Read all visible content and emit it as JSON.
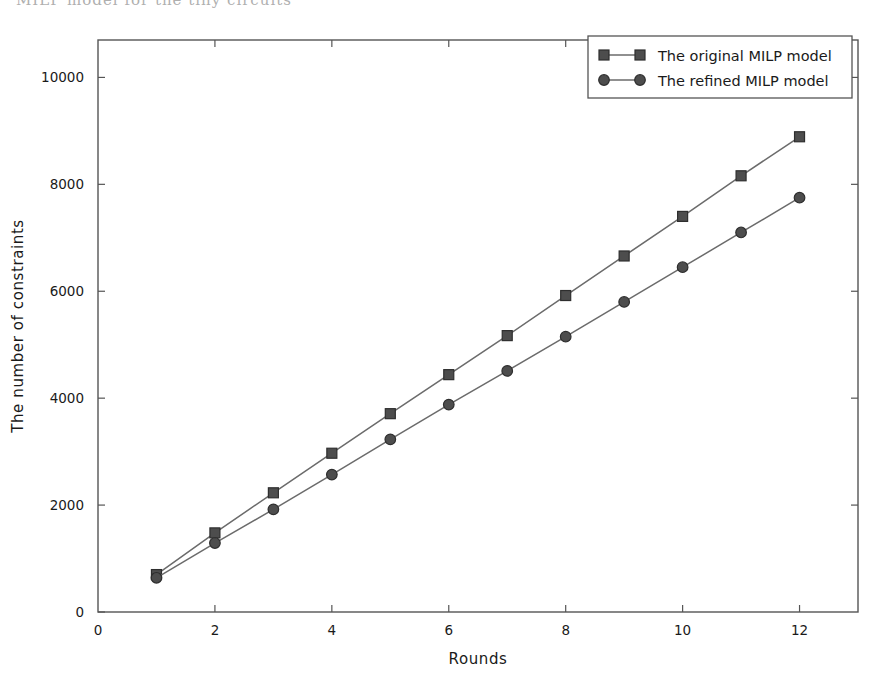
{
  "page": {
    "top_artifact_text": "MILP model for the tiny circuits"
  },
  "chart_data": {
    "type": "line",
    "title": "",
    "xlabel": "Rounds",
    "ylabel": "The number of constraints",
    "x": [
      1,
      2,
      3,
      4,
      5,
      6,
      7,
      8,
      9,
      10,
      11,
      12
    ],
    "xlim": [
      0,
      13
    ],
    "ylim": [
      0,
      10700
    ],
    "xticks": [
      0,
      2,
      4,
      6,
      8,
      10,
      12
    ],
    "xtick_labels": [
      "0",
      "2",
      "4",
      "6",
      "8",
      "10",
      "12"
    ],
    "yticks": [
      0,
      2000,
      4000,
      6000,
      8000,
      10000
    ],
    "ytick_labels": [
      "0",
      "2000",
      "4000",
      "6000",
      "8000",
      "10000"
    ],
    "grid": false,
    "legend_position": "top-right",
    "series": [
      {
        "name": "The original MILP model",
        "marker": "square",
        "color": "#4d4d4d",
        "line_color": "#6b6b6b",
        "values": [
          700,
          1480,
          2230,
          2970,
          3710,
          4440,
          5170,
          5920,
          6660,
          7400,
          8160,
          8890
        ]
      },
      {
        "name": "The refined MILP model",
        "marker": "circle",
        "color": "#4d4d4d",
        "line_color": "#6b6b6b",
        "values": [
          640,
          1290,
          1920,
          2570,
          3230,
          3880,
          4510,
          5150,
          5800,
          6450,
          7100,
          7750
        ]
      }
    ]
  },
  "axes": {
    "frame_color": "#555555"
  }
}
